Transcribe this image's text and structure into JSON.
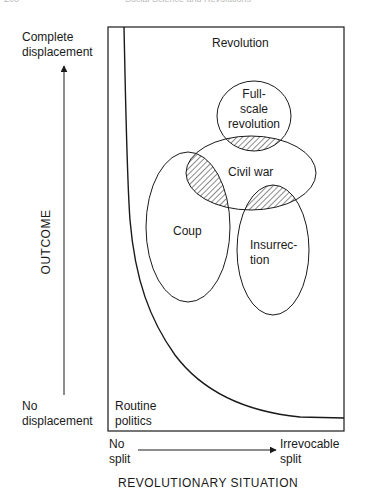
{
  "header": {
    "page_number": "200",
    "running_title": "Social Science and Revolutions"
  },
  "diagram": {
    "region_top_label": "Revolution",
    "region_bottom_label": [
      "Routine",
      "politics"
    ],
    "y_axis": {
      "title": "OUTCOME",
      "top_label": [
        "Complete",
        "displacement"
      ],
      "bottom_label": [
        "No",
        "displacement"
      ]
    },
    "x_axis": {
      "title": "REVOLUTIONARY SITUATION",
      "left_label": [
        "No",
        "split"
      ],
      "right_label": [
        "Irrevocable",
        "split"
      ]
    },
    "ellipses": [
      {
        "id": "full-scale-revolution",
        "label": [
          "Full-",
          "scale",
          "revolution"
        ]
      },
      {
        "id": "civil-war",
        "label": [
          "Civil war"
        ]
      },
      {
        "id": "coup",
        "label": [
          "Coup"
        ]
      },
      {
        "id": "insurrection",
        "label": [
          "Insurrec-",
          "tion"
        ]
      }
    ],
    "hatched_overlaps": [
      "full-scale-revolution ∩ civil-war",
      "coup ∩ civil-war",
      "insurrection ∩ civil-war"
    ],
    "line_color": "#1a1a1a"
  }
}
